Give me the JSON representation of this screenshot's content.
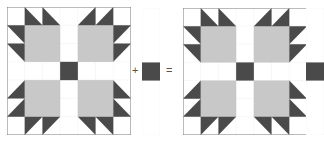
{
  "diagram": {
    "operators": {
      "plus": "+",
      "equals": "="
    },
    "colors": {
      "dark": "#4a4a4a",
      "gray": "#c8c8c8",
      "light": "#ffffff",
      "line": "#7a7a7a"
    },
    "grid": {
      "cols": 7,
      "rows": 7
    },
    "parts": [
      {
        "name": "bears-paw-block",
        "type": "block"
      },
      {
        "name": "sashing-strip",
        "type": "strip",
        "cells": 7,
        "dark_cell_index": 3
      },
      {
        "name": "block-with-strip",
        "type": "block+strip"
      }
    ],
    "cells": {
      "corner": [
        [
          0,
          0
        ],
        [
          0,
          6
        ],
        [
          6,
          0
        ],
        [
          6,
          6
        ]
      ],
      "paw_squares": [
        [
          1,
          1
        ],
        [
          1,
          4
        ],
        [
          4,
          1
        ],
        [
          4,
          4
        ]
      ],
      "center": [
        3,
        3
      ],
      "sashing": [
        [
          0,
          3
        ],
        [
          1,
          3
        ],
        [
          2,
          3
        ],
        [
          4,
          3
        ],
        [
          5,
          3
        ],
        [
          6,
          3
        ],
        [
          3,
          0
        ],
        [
          3,
          1
        ],
        [
          3,
          2
        ],
        [
          3,
          4
        ],
        [
          3,
          5
        ],
        [
          3,
          6
        ]
      ],
      "hst": [
        {
          "r": 0,
          "c": 1,
          "pts": "0,0 0,1 1,1"
        },
        {
          "r": 0,
          "c": 2,
          "pts": "0,0 0,1 1,1"
        },
        {
          "r": 1,
          "c": 0,
          "pts": "0,0 1,0 1,1"
        },
        {
          "r": 2,
          "c": 0,
          "pts": "0,0 1,0 1,1"
        },
        {
          "r": 0,
          "c": 4,
          "pts": "0,1 1,1 1,0"
        },
        {
          "r": 0,
          "c": 5,
          "pts": "0,1 1,1 1,0"
        },
        {
          "r": 1,
          "c": 6,
          "pts": "0,0 1,0 0,1"
        },
        {
          "r": 2,
          "c": 6,
          "pts": "0,0 1,0 0,1"
        },
        {
          "r": 4,
          "c": 0,
          "pts": "1,0 1,1 0,1"
        },
        {
          "r": 5,
          "c": 0,
          "pts": "1,0 1,1 0,1"
        },
        {
          "r": 6,
          "c": 1,
          "pts": "0,0 1,0 0,1"
        },
        {
          "r": 6,
          "c": 2,
          "pts": "0,0 1,0 0,1"
        },
        {
          "r": 4,
          "c": 6,
          "pts": "0,0 0,1 1,1"
        },
        {
          "r": 5,
          "c": 6,
          "pts": "0,0 0,1 1,1"
        },
        {
          "r": 6,
          "c": 4,
          "pts": "0,0 1,0 1,1"
        },
        {
          "r": 6,
          "c": 5,
          "pts": "0,0 1,0 1,1"
        }
      ]
    }
  }
}
